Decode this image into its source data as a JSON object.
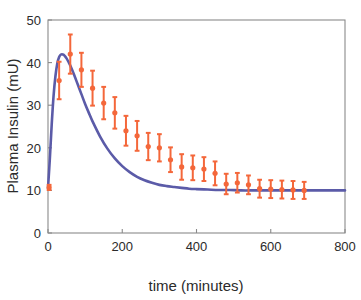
{
  "chart_data": {
    "type": "scatter",
    "title": "",
    "xlabel": "time (minutes)",
    "ylabel": "Plasma Insulin (mU)",
    "xlim": [
      0,
      800
    ],
    "ylim": [
      0,
      50
    ],
    "xticks": [
      0,
      200,
      400,
      600,
      800
    ],
    "yticks": [
      0,
      10,
      20,
      30,
      40,
      50
    ],
    "xtick_labels": [
      "0",
      "200",
      "400",
      "600",
      "800"
    ],
    "ytick_labels": [
      "0",
      "10",
      "20",
      "30",
      "40",
      "50"
    ],
    "grid": false,
    "legend": null,
    "series": [
      {
        "name": "Experimental data (mean ± SD)",
        "type": "errorbar",
        "color": "#F4673A",
        "marker": "circle",
        "x": [
          3,
          30,
          60,
          90,
          120,
          150,
          180,
          210,
          240,
          270,
          300,
          330,
          360,
          390,
          420,
          450,
          480,
          510,
          540,
          570,
          600,
          630,
          660,
          690
        ],
        "y": [
          10.7,
          35.8,
          42.0,
          38.3,
          34.0,
          30.5,
          28.2,
          24.0,
          22.8,
          20.3,
          20.0,
          17.2,
          15.5,
          15.3,
          15.0,
          14.0,
          11.5,
          11.8,
          11.3,
          10.4,
          10.3,
          10.2,
          10.1,
          10.0
        ],
        "yerr": [
          0.6,
          4.4,
          4.6,
          4.0,
          4.1,
          3.8,
          3.7,
          3.5,
          3.5,
          3.2,
          3.2,
          2.9,
          3.0,
          2.9,
          2.8,
          2.8,
          2.4,
          2.3,
          2.2,
          2.1,
          2.1,
          2.1,
          2.1,
          2.0
        ]
      },
      {
        "name": "Model simulation",
        "type": "line",
        "color": "#5B5BA8",
        "x": [
          0,
          5,
          10,
          15,
          20,
          25,
          30,
          35,
          40,
          45,
          50,
          55,
          60,
          70,
          80,
          90,
          100,
          110,
          120,
          140,
          160,
          180,
          200,
          220,
          240,
          260,
          280,
          300,
          320,
          340,
          360,
          380,
          400,
          430,
          460,
          490,
          520,
          560,
          600,
          650,
          700,
          750,
          800
        ],
        "y": [
          10.5,
          17.5,
          25.5,
          32.2,
          36.8,
          39.8,
          41.3,
          41.9,
          41.9,
          41.6,
          41.0,
          40.2,
          39.3,
          37.2,
          34.9,
          32.6,
          30.3,
          28.2,
          26.2,
          22.7,
          19.8,
          17.5,
          15.7,
          14.3,
          13.2,
          12.4,
          11.8,
          11.3,
          11.0,
          10.8,
          10.6,
          10.4,
          10.3,
          10.2,
          10.1,
          10.1,
          10.0,
          10.0,
          10.0,
          10.0,
          10.0,
          10.0,
          10.0
        ]
      }
    ],
    "axes_pixel_geometry": {
      "left": 48,
      "right": 345,
      "top": 20,
      "bottom": 233
    }
  }
}
